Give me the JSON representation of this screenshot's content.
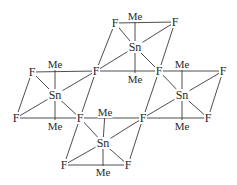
{
  "diagram": {
    "title": "",
    "colors": {
      "line": "#3a3a3a",
      "text": "#2a2a2a",
      "background": "#ffffff"
    },
    "atoms": [
      {
        "id": "F1",
        "label": "F",
        "x": 115,
        "y": 23
      },
      {
        "id": "Me1",
        "label": "Me",
        "x": 135,
        "y": 16
      },
      {
        "id": "F2",
        "label": "F",
        "x": 175,
        "y": 22
      },
      {
        "id": "Sn1",
        "label": "Sn",
        "x": 135,
        "y": 47
      },
      {
        "id": "Me2",
        "label": "Me",
        "x": 135,
        "y": 79
      },
      {
        "id": "Fb1",
        "label": "F",
        "x": 96,
        "y": 71
      },
      {
        "id": "Fb2",
        "label": "F",
        "x": 159,
        "y": 71
      },
      {
        "id": "F3",
        "label": "F",
        "x": 32,
        "y": 72
      },
      {
        "id": "Me3",
        "label": "Me",
        "x": 55,
        "y": 64
      },
      {
        "id": "Sn2",
        "label": "Sn",
        "x": 55,
        "y": 95
      },
      {
        "id": "F4",
        "label": "F",
        "x": 16,
        "y": 118
      },
      {
        "id": "Me4",
        "label": "Me",
        "x": 55,
        "y": 126
      },
      {
        "id": "Me5",
        "label": "Me",
        "x": 182,
        "y": 64
      },
      {
        "id": "F5",
        "label": "F",
        "x": 223,
        "y": 71
      },
      {
        "id": "Sn3",
        "label": "Sn",
        "x": 182,
        "y": 95
      },
      {
        "id": "F6",
        "label": "F",
        "x": 208,
        "y": 118
      },
      {
        "id": "Me6",
        "label": "Me",
        "x": 182,
        "y": 126
      },
      {
        "id": "Fb3",
        "label": "F",
        "x": 80,
        "y": 118
      },
      {
        "id": "Fb4",
        "label": "F",
        "x": 143,
        "y": 118
      },
      {
        "id": "Me7",
        "label": "Me",
        "x": 105,
        "y": 112
      },
      {
        "id": "Sn4",
        "label": "Sn",
        "x": 103,
        "y": 143
      },
      {
        "id": "F7",
        "label": "F",
        "x": 64,
        "y": 165
      },
      {
        "id": "F8",
        "label": "F",
        "x": 128,
        "y": 165
      },
      {
        "id": "Me8",
        "label": "Me",
        "x": 103,
        "y": 172
      }
    ],
    "bonds": [
      [
        "F1",
        "F2"
      ],
      [
        "F1",
        "Fb1"
      ],
      [
        "F2",
        "Fb2"
      ],
      [
        "Sn1",
        "Me1"
      ],
      [
        "Sn1",
        "Me2"
      ],
      [
        "Sn1",
        "F1"
      ],
      [
        "Sn1",
        "F2"
      ],
      [
        "Sn1",
        "Fb1"
      ],
      [
        "Sn1",
        "Fb2"
      ],
      [
        "Fb1",
        "Fb2"
      ],
      [
        "F3",
        "Fb1"
      ],
      [
        "Fb2",
        "F5"
      ],
      [
        "F3",
        "F4"
      ],
      [
        "F4",
        "Fb3"
      ],
      [
        "Fb1",
        "Fb3"
      ],
      [
        "Sn2",
        "Me3"
      ],
      [
        "Sn2",
        "Me4"
      ],
      [
        "Sn2",
        "F3"
      ],
      [
        "Sn2",
        "F4"
      ],
      [
        "Sn2",
        "Fb1"
      ],
      [
        "Sn2",
        "Fb3"
      ],
      [
        "F5",
        "F6"
      ],
      [
        "Fb4",
        "F6"
      ],
      [
        "Fb2",
        "Fb4"
      ],
      [
        "Sn3",
        "Me5"
      ],
      [
        "Sn3",
        "Me6"
      ],
      [
        "Sn3",
        "F5"
      ],
      [
        "Sn3",
        "F6"
      ],
      [
        "Sn3",
        "Fb2"
      ],
      [
        "Sn3",
        "Fb4"
      ],
      [
        "Fb3",
        "Fb4"
      ],
      [
        "Fb3",
        "F7"
      ],
      [
        "Fb4",
        "F8"
      ],
      [
        "F7",
        "F8"
      ],
      [
        "Sn4",
        "Me7"
      ],
      [
        "Sn4",
        "Me8"
      ],
      [
        "Sn4",
        "Fb3"
      ],
      [
        "Sn4",
        "Fb4"
      ],
      [
        "Sn4",
        "F7"
      ],
      [
        "Sn4",
        "F8"
      ]
    ]
  }
}
